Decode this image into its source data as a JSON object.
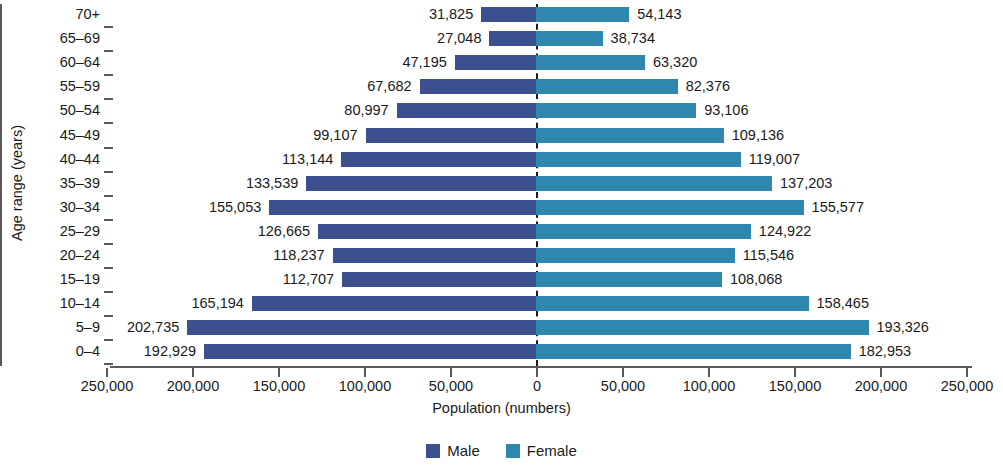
{
  "chart_data": {
    "type": "bar",
    "subtype": "population-pyramid",
    "title": "",
    "xlabel": "Population (numbers)",
    "ylabel": "Age range (years)",
    "categories": [
      "70+",
      "65–69",
      "60–64",
      "55–59",
      "50–54",
      "45–49",
      "40–44",
      "35–39",
      "30–34",
      "25–29",
      "20–24",
      "15–19",
      "10–14",
      "5–9",
      "0–4"
    ],
    "series": [
      {
        "name": "Male",
        "color": "#3c4f8e",
        "side": "left",
        "values": [
          31825,
          27048,
          47195,
          67682,
          80997,
          99107,
          113144,
          133539,
          155053,
          126665,
          118237,
          112707,
          165194,
          202735,
          192929
        ],
        "labels": [
          "31,825",
          "27,048",
          "47,195",
          "67,682",
          "80,997",
          "99,107",
          "113,144",
          "133,539",
          "155,053",
          "126,665",
          "118,237",
          "112,707",
          "165,194",
          "202,735",
          "192,929"
        ]
      },
      {
        "name": "Female",
        "color": "#2f87ad",
        "side": "right",
        "values": [
          54143,
          38734,
          63320,
          82376,
          93106,
          109136,
          119007,
          137203,
          155577,
          124922,
          115546,
          108068,
          158465,
          193326,
          182953
        ],
        "labels": [
          "54,143",
          "38,734",
          "63,320",
          "82,376",
          "93,106",
          "109,136",
          "119,007",
          "137,203",
          "155,577",
          "124,922",
          "115,546",
          "108,068",
          "158,465",
          "193,326",
          "182,953"
        ]
      }
    ],
    "xticks": [
      {
        "value": -250000,
        "label": "250,000"
      },
      {
        "value": -200000,
        "label": "200,000"
      },
      {
        "value": -150000,
        "label": "150,000"
      },
      {
        "value": -100000,
        "label": "100,000"
      },
      {
        "value": -50000,
        "label": "50,000"
      },
      {
        "value": 0,
        "label": "0"
      },
      {
        "value": 50000,
        "label": "50,000"
      },
      {
        "value": 100000,
        "label": "100,000"
      },
      {
        "value": 150000,
        "label": "150,000"
      },
      {
        "value": 200000,
        "label": "200,000"
      },
      {
        "value": 250000,
        "label": "250,000"
      }
    ],
    "xlim": [
      -250000,
      250000
    ],
    "grid": false,
    "legend": {
      "position": "bottom",
      "entries": [
        {
          "label": "Male",
          "color": "#3c4f8e"
        },
        {
          "label": "Female",
          "color": "#2f87ad"
        }
      ]
    },
    "center_divider": "dashed"
  }
}
